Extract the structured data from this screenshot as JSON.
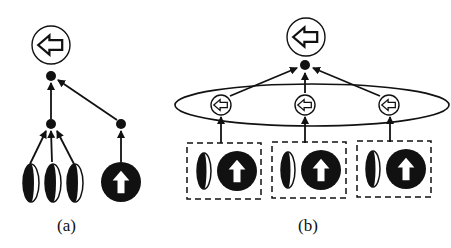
{
  "diagram": {
    "panels": [
      {
        "id": "a",
        "caption": "(a)",
        "description": "Hierarchical tree: three half-filled ellipse features and one filled circle with up-arrow feed intermediate nodes which converge to a root node producing a left-arrow output",
        "leaves": [
          {
            "type": "half-filled-ellipse"
          },
          {
            "type": "half-filled-ellipse"
          },
          {
            "type": "half-filled-ellipse"
          },
          {
            "type": "filled-circle-up-arrow"
          }
        ],
        "output": {
          "type": "circle-left-arrow"
        }
      },
      {
        "id": "b",
        "caption": "(b)",
        "description": "Three dashed groups each containing a half-filled ellipse and a filled circle with up-arrow; each group feeds a small left-arrow circle; the three are enclosed by a large ellipse and converge to a root node producing a left-arrow output",
        "groups": [
          {
            "items": [
              "half-filled-ellipse",
              "filled-circle-up-arrow"
            ],
            "output": "small-circle-left-arrow"
          },
          {
            "items": [
              "half-filled-ellipse",
              "filled-circle-up-arrow"
            ],
            "output": "small-circle-left-arrow"
          },
          {
            "items": [
              "half-filled-ellipse",
              "filled-circle-up-arrow"
            ],
            "output": "small-circle-left-arrow"
          }
        ],
        "output": {
          "type": "circle-left-arrow"
        }
      }
    ],
    "colors": {
      "stroke": "#111111",
      "fill": "#111111",
      "background": "#ffffff"
    }
  }
}
